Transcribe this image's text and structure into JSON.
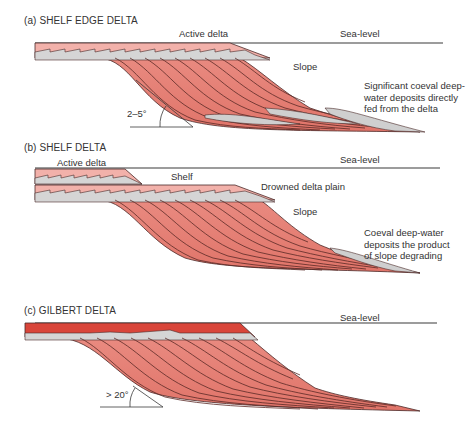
{
  "panels": [
    {
      "id": "a",
      "title": "(a) SHELF EDGE DELTA",
      "labels": {
        "active_delta": "Active delta",
        "sea_level": "Sea-level",
        "slope": "Slope",
        "angle": "2–5°",
        "note_lines": [
          "Significant coeval deep-",
          "water deposits directly",
          "fed from the delta"
        ]
      }
    },
    {
      "id": "b",
      "title": "(b) SHELF DELTA",
      "labels": {
        "active_delta": "Active delta",
        "shelf": "Shelf",
        "sea_level": "Sea-level",
        "drowned_delta_plain": "Drowned delta plain",
        "slope": "Slope",
        "note_lines": [
          "Coeval deep-water",
          "deposits the product",
          "of slope degrading"
        ]
      }
    },
    {
      "id": "c",
      "title": "(c) GILBERT DELTA",
      "labels": {
        "sea_level": "Sea-level",
        "angle": "> 20°"
      }
    }
  ],
  "colors": {
    "delta_pink": "#e8847c",
    "delta_light": "#f2b1aa",
    "gilbert_topset": "#d9453a",
    "grey_deposit": "#cfcfcf",
    "line": "#3a3a3a"
  }
}
